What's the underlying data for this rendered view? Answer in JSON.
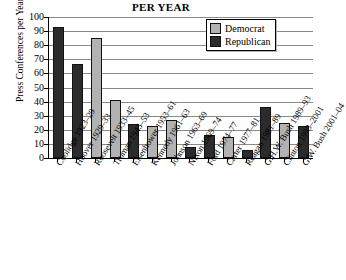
{
  "chart_data": {
    "type": "bar",
    "title": "PER YEAR",
    "xlabel": "",
    "ylabel": "Press Conferences per Year",
    "ylim": [
      0,
      100
    ],
    "ytick_step": 10,
    "yticks": [
      0,
      10,
      20,
      30,
      40,
      50,
      60,
      70,
      80,
      90,
      100
    ],
    "grid": true,
    "legend_position": "top-right",
    "categories": [
      "Coolidge 1923–29",
      "Hoover 1929–33",
      "Roosevelt 1933–45",
      "Truman 1945–53",
      "Eisenhower 1953–61",
      "Kennedy 1961–63",
      "Johnson 1963–69",
      "Nixon 1969–74",
      "Ford 1974–77",
      "Carter 1977–81",
      "Reagan 1981–89",
      "G.H.W. Bush 1989–93",
      "Clinton 1993–2001",
      "G.W. Bush 2001–04"
    ],
    "values": [
      93,
      67,
      85,
      41,
      24,
      23,
      27,
      8,
      16,
      15,
      6,
      36,
      25,
      23
    ],
    "party": [
      "rep",
      "rep",
      "dem",
      "dem",
      "rep",
      "dem",
      "dem",
      "rep",
      "rep",
      "dem",
      "rep",
      "rep",
      "dem",
      "rep"
    ],
    "series": [
      {
        "name": "Democrat",
        "color": "#b2b2b2",
        "points": [
          {
            "category": "Roosevelt 1933–45",
            "value": 85
          },
          {
            "category": "Truman 1945–53",
            "value": 41
          },
          {
            "category": "Kennedy 1961–63",
            "value": 23
          },
          {
            "category": "Johnson 1963–69",
            "value": 27
          },
          {
            "category": "Carter 1977–81",
            "value": 15
          },
          {
            "category": "Clinton 1993–2001",
            "value": 25
          }
        ]
      },
      {
        "name": "Republican",
        "color": "#2b2b2b",
        "points": [
          {
            "category": "Coolidge 1923–29",
            "value": 93
          },
          {
            "category": "Hoover 1929–33",
            "value": 67
          },
          {
            "category": "Eisenhower 1953–61",
            "value": 24
          },
          {
            "category": "Nixon 1969–74",
            "value": 8
          },
          {
            "category": "Ford 1974–77",
            "value": 16
          },
          {
            "category": "Reagan 1981–89",
            "value": 6
          },
          {
            "category": "G.H.W. Bush 1989–93",
            "value": 36
          },
          {
            "category": "G.W. Bush 2001–04",
            "value": 23
          }
        ]
      }
    ]
  },
  "legend": {
    "items": [
      {
        "label": "Democrat",
        "key": "dem"
      },
      {
        "label": "Republican",
        "key": "rep"
      }
    ]
  }
}
